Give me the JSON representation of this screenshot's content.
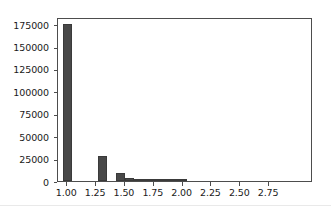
{
  "figure": {
    "width": 331,
    "height": 209,
    "background_color": "#ffffff",
    "footer_rule_color": "#e9e9e9"
  },
  "chart_data": {
    "type": "bar",
    "subtype": "histogram",
    "title": "",
    "subtitle": "",
    "xlabel": "",
    "ylabel": "",
    "grid": false,
    "legend": null,
    "legend_position": "none",
    "bar_color": "#484848",
    "bar_edge_color": "#3a3a3a",
    "axis_color": "#4d4d4d",
    "tick_label_color": "#1a1a1a",
    "xlim": [
      0.92,
      3.13
    ],
    "ylim": [
      0,
      183000
    ],
    "bin_width": 0.077,
    "xticks": [
      1.0,
      1.25,
      1.5,
      1.75,
      2.0,
      2.25,
      2.5,
      2.75
    ],
    "xtick_labels": [
      "1.00",
      "1.25",
      "1.50",
      "1.75",
      "2.00",
      "2.25",
      "2.50",
      "2.75"
    ],
    "yticks": [
      0,
      25000,
      50000,
      75000,
      100000,
      125000,
      150000,
      175000
    ],
    "ytick_labels": [
      "0",
      "25000",
      "50000",
      "75000",
      "100000",
      "125000",
      "150000",
      "175000"
    ],
    "x": [
      1.0,
      1.077,
      1.154,
      1.231,
      1.308,
      1.385,
      1.462,
      1.538,
      1.615,
      1.692,
      1.769,
      1.846,
      1.923,
      2.0,
      2.077,
      2.154,
      2.231,
      2.308,
      2.385,
      2.462,
      2.538,
      2.615,
      2.692,
      2.769,
      2.846,
      2.923,
      3.0
    ],
    "values": [
      175000,
      0,
      0,
      0,
      27500,
      0,
      8700,
      3200,
      1400,
      700,
      400,
      200,
      100,
      60,
      0,
      0,
      0,
      0,
      0,
      0,
      0,
      0,
      0,
      0,
      0,
      0,
      0
    ],
    "categories": [
      "1.000",
      "1.077",
      "1.154",
      "1.231",
      "1.308",
      "1.385",
      "1.462",
      "1.538",
      "1.615",
      "1.692",
      "1.769",
      "1.846",
      "1.923",
      "2.000",
      "2.077",
      "2.154",
      "2.231",
      "2.308",
      "2.385",
      "2.462",
      "2.538",
      "2.615",
      "2.692",
      "2.769",
      "2.846",
      "2.923",
      "3.000"
    ],
    "annotations": []
  }
}
